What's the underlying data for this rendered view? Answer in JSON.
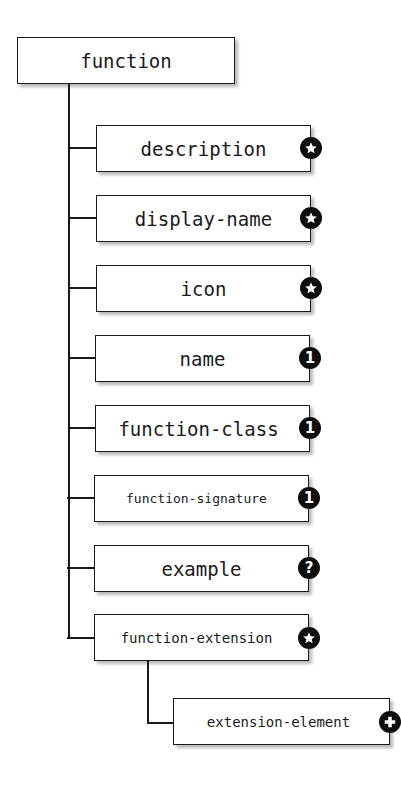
{
  "diagram": {
    "root": {
      "label": "function"
    },
    "children": [
      {
        "label": "description",
        "cardinality": "zero-or-more",
        "badge_glyph": "star"
      },
      {
        "label": "display-name",
        "cardinality": "zero-or-more",
        "badge_glyph": "star"
      },
      {
        "label": "icon",
        "cardinality": "zero-or-more",
        "badge_glyph": "star"
      },
      {
        "label": "name",
        "cardinality": "exactly-one",
        "badge_glyph": "1"
      },
      {
        "label": "function-class",
        "cardinality": "exactly-one",
        "badge_glyph": "1"
      },
      {
        "label": "function-signature",
        "cardinality": "exactly-one",
        "badge_glyph": "1"
      },
      {
        "label": "example",
        "cardinality": "optional",
        "badge_glyph": "?"
      },
      {
        "label": "function-extension",
        "cardinality": "zero-or-more",
        "badge_glyph": "star",
        "children": [
          {
            "label": "extension-element",
            "cardinality": "one-or-more",
            "badge_glyph": "plus"
          }
        ]
      }
    ],
    "colors": {
      "line": "#1a1a1a",
      "badge": "#0d0d0d",
      "badge_text": "#ffffff",
      "box_bg": "#ffffff"
    }
  }
}
